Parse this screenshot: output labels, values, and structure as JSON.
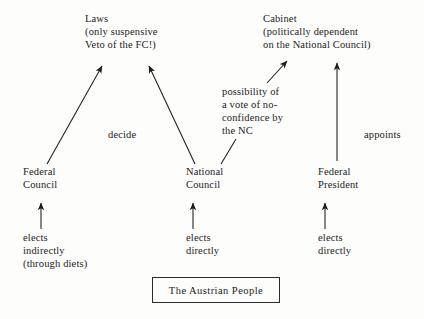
{
  "diagram": {
    "background_color": "#fdfdfb",
    "ink_color": "#1c1c1c",
    "top_nodes": [
      {
        "name": "laws",
        "lines": [
          "Laws",
          "(only suspensive",
          "Veto of the FC!)"
        ],
        "line1": "Laws",
        "line2": "(only suspensive",
        "line3": "Veto of the FC!)"
      },
      {
        "name": "cabinet",
        "lines": [
          "Cabinet",
          "(politically dependent",
          "on the National Council)"
        ],
        "line1": "Cabinet",
        "line2": "(politically dependent",
        "line3": "on the National Council)"
      }
    ],
    "middle_nodes": [
      {
        "name": "federal-council",
        "line1": "Federal",
        "line2": "Council"
      },
      {
        "name": "national-council",
        "line1": "National",
        "line2": "Council"
      },
      {
        "name": "federal-president",
        "line1": "Federal",
        "line2": "President"
      }
    ],
    "edge_labels": {
      "decide": "decide",
      "appoints": "appoints",
      "no_confidence": {
        "line1": "possibility of",
        "line2": "a vote of no-",
        "line3": "confidence by",
        "line4": "the NC"
      },
      "elects_indirectly": {
        "line1": "elects",
        "line2": "indirectly",
        "line3": "(through diets)"
      },
      "elects_directly_nc": {
        "line1": "elects",
        "line2": "directly"
      },
      "elects_directly_fp": {
        "line1": "elects",
        "line2": "directly"
      }
    },
    "people_box": {
      "label": "The Austrian People"
    }
  }
}
